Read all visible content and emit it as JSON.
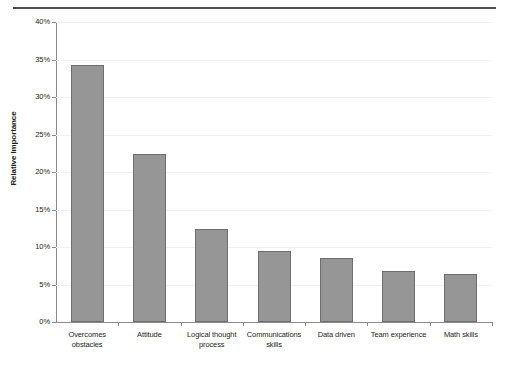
{
  "chart_data": {
    "type": "bar",
    "title": "",
    "xlabel": "",
    "ylabel": "Relative Importance",
    "categories": [
      "Overcomes obstacles",
      "Attitude",
      "Logical thought process",
      "Communications skills",
      "Data driven",
      "Team experience",
      "Math skills"
    ],
    "values": [
      34.3,
      22.4,
      12.4,
      9.5,
      8.5,
      6.8,
      6.4
    ],
    "ylim": [
      0,
      40
    ],
    "ytick_values": [
      0,
      5,
      10,
      15,
      20,
      25,
      30,
      35,
      40
    ],
    "ytick_labels": [
      "0%",
      "5%",
      "10%",
      "15%",
      "20%",
      "25%",
      "30%",
      "35%",
      "40%"
    ],
    "grid": true,
    "legend": "none",
    "bar_color": "#969696",
    "bar_border_color": "#6e6e6e",
    "axis_color": "#8a8a8a",
    "gridline_color": "#f1f1f1",
    "rule_color": "#4d4d4d"
  },
  "axis": {
    "y_title": "Relative Importance"
  },
  "category_labels": [
    {
      "line1": "Overcomes",
      "line2": "obstacles"
    },
    {
      "line1": "Attitude",
      "line2": ""
    },
    {
      "line1": "Logical thought",
      "line2": "process"
    },
    {
      "line1": "Communications",
      "line2": "skills"
    },
    {
      "line1": "Data driven",
      "line2": ""
    },
    {
      "line1": "Team experience",
      "line2": ""
    },
    {
      "line1": "Math skills",
      "line2": ""
    }
  ],
  "ytick_labels": [
    "40%",
    "35%",
    "30%",
    "25%",
    "20%",
    "15%",
    "10%",
    "5%",
    "0%"
  ]
}
